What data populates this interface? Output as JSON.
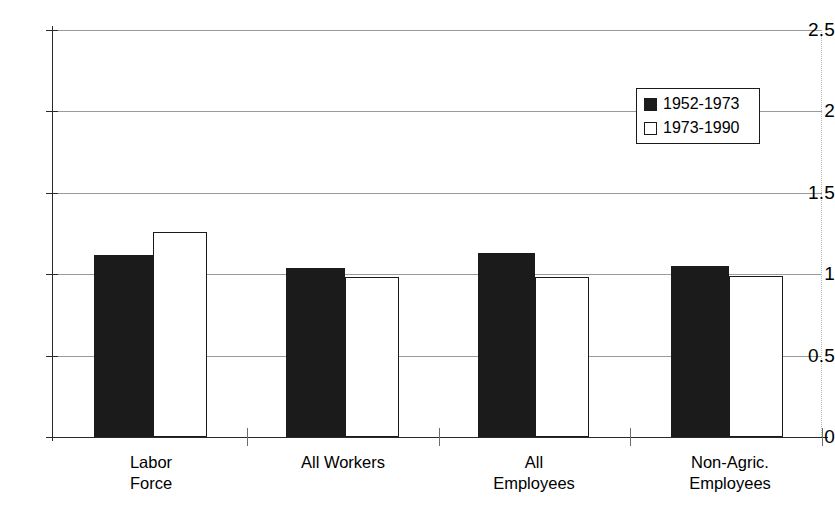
{
  "chart_data": {
    "type": "bar",
    "title": "",
    "xlabel": "",
    "ylabel": "",
    "categories": [
      "Labor\nForce",
      "All Workers",
      "All\nEmployees",
      "Non-Agric.\nEmployees"
    ],
    "series": [
      {
        "name": "1952-1973",
        "values": [
          1.12,
          1.04,
          1.13,
          1.05
        ],
        "color": "#1b1b1b",
        "swatch": "filled"
      },
      {
        "name": "1973-1990",
        "values": [
          1.26,
          0.98,
          0.98,
          0.99
        ],
        "color": "#ffffff",
        "swatch": "hollow"
      }
    ],
    "ylim": [
      0,
      2.5
    ],
    "yticks": [
      "0",
      "0.5",
      "1",
      "1.5",
      "2",
      "2.5"
    ],
    "ytick_values": [
      0,
      0.5,
      1,
      1.5,
      2,
      2.5
    ],
    "grid": "horizontal",
    "legend_position": "top-right",
    "legend_entries": [
      "1952-1973",
      "1973-1990"
    ]
  },
  "axis": {
    "y_labels": {
      "t0": "0",
      "t1": "0.5",
      "t2": "1",
      "t3": "1.5",
      "t4": "2",
      "t5": "2.5"
    }
  },
  "legend": {
    "entries": [
      {
        "label": "1952-1973"
      },
      {
        "label": "1973-1990"
      }
    ]
  },
  "categories": [
    {
      "label": "Labor\nForce"
    },
    {
      "label": "All Workers"
    },
    {
      "label": "All\nEmployees"
    },
    {
      "label": "Non-Agric.\nEmployees"
    }
  ]
}
